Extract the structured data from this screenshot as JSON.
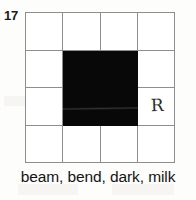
{
  "item": {
    "number": "17"
  },
  "grid": {
    "rows": 4,
    "columns": 4,
    "cells": [
      [
        {
          "filled": false,
          "mark": ""
        },
        {
          "filled": false,
          "mark": ""
        },
        {
          "filled": false,
          "mark": ""
        },
        {
          "filled": false,
          "mark": ""
        }
      ],
      [
        {
          "filled": false,
          "mark": ""
        },
        {
          "filled": true,
          "mark": ""
        },
        {
          "filled": true,
          "mark": ""
        },
        {
          "filled": false,
          "mark": ""
        }
      ],
      [
        {
          "filled": false,
          "mark": ""
        },
        {
          "filled": true,
          "mark": ""
        },
        {
          "filled": true,
          "mark": ""
        },
        {
          "filled": false,
          "mark": "R"
        }
      ],
      [
        {
          "filled": false,
          "mark": ""
        },
        {
          "filled": false,
          "mark": ""
        },
        {
          "filled": false,
          "mark": ""
        },
        {
          "filled": false,
          "mark": ""
        }
      ]
    ]
  },
  "word_list": {
    "text": "beam, bend, dark, milk",
    "words": [
      "beam",
      "bend",
      "dark",
      "milk"
    ]
  },
  "colors": {
    "filled_cell": "#080808",
    "grid_line": "#8e8e8e",
    "page_background": "#fdfdfc",
    "text": "#141414",
    "handwriting": "#2b2b2b"
  }
}
